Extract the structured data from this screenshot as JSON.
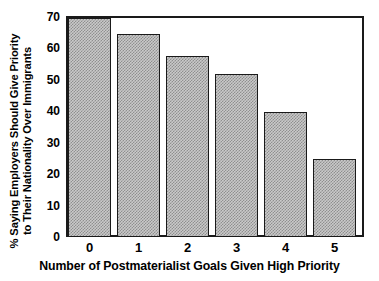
{
  "chart_data": {
    "type": "bar",
    "title": "",
    "categories": [
      "0",
      "1",
      "2",
      "3",
      "4",
      "5"
    ],
    "values": [
      70,
      65,
      58,
      52,
      40,
      25
    ],
    "xlabel": "Number of Postmaterialist Goals Given High Priority",
    "ylabel": "% Saying Employers Should Give Priority to Their Nationality Over Immigrants",
    "ylabel_lines": [
      "% Saying Employers Should Give Priority",
      "to Their Nationality Over Immigrants"
    ],
    "ylim": [
      0,
      70
    ],
    "yticks": [
      0,
      10,
      20,
      30,
      40,
      50,
      60,
      70
    ],
    "ytick_labels": [
      "0",
      "10",
      "20",
      "30",
      "40",
      "50",
      "60",
      "70"
    ],
    "grid": false,
    "legend": null,
    "bar_fill_color": "#c9c9c9",
    "bar_edge_color": "#1a1a1a",
    "axis_color": "#1a1a1a"
  }
}
